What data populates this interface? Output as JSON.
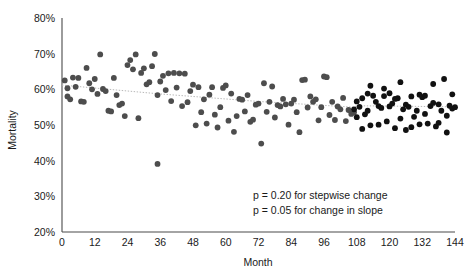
{
  "chart_data": {
    "type": "scatter",
    "title": "",
    "xlabel": "Month",
    "ylabel": "Mortality",
    "xlim": [
      0,
      144
    ],
    "ylim": [
      20,
      80
    ],
    "grid": false,
    "legend": "none",
    "x_ticks": [
      0,
      12,
      24,
      36,
      48,
      60,
      72,
      84,
      96,
      108,
      120,
      132,
      144
    ],
    "x_tick_labels": [
      "0",
      "12",
      "24",
      "36",
      "48",
      "60",
      "72",
      "84",
      "96",
      "108",
      "120",
      "132",
      "144"
    ],
    "y_ticks": [
      20,
      30,
      40,
      50,
      60,
      70,
      80
    ],
    "y_tick_labels": [
      "20%",
      "30%",
      "40%",
      "50%",
      "60%",
      "70%",
      "80%"
    ],
    "annotations": [
      "p = 0.20 for stepwise change",
      "p = 0.05 for change in slope"
    ],
    "trendline": {
      "name": "fitted dotted trend",
      "color": "#b8b8b8",
      "style": "dotted",
      "x": [
        0,
        36,
        72,
        107,
        108,
        144
      ],
      "y": [
        61.2,
        58.7,
        56.6,
        55.0,
        55.4,
        55.1
      ]
    },
    "series": [
      {
        "name": "Pre-intervention (gray)",
        "color": "#4d4d4d",
        "marker": "filled-circle",
        "points": [
          [
            1,
            62.5
          ],
          [
            2,
            60.3
          ],
          [
            2,
            58.0
          ],
          [
            3,
            57.2
          ],
          [
            4,
            63.3
          ],
          [
            5,
            60.7
          ],
          [
            6,
            63.2
          ],
          [
            7,
            56.6
          ],
          [
            8,
            56.5
          ],
          [
            9,
            66.0
          ],
          [
            10,
            61.7
          ],
          [
            11,
            60.0
          ],
          [
            12,
            62.9
          ],
          [
            13,
            58.7
          ],
          [
            14,
            69.8
          ],
          [
            15,
            60.1
          ],
          [
            16,
            59.5
          ],
          [
            17,
            54.0
          ],
          [
            18,
            53.8
          ],
          [
            19,
            63.2
          ],
          [
            20,
            58.4
          ],
          [
            21,
            55.6
          ],
          [
            22,
            56.0
          ],
          [
            23,
            52.5
          ],
          [
            24,
            66.8
          ],
          [
            25,
            68.2
          ],
          [
            26,
            65.6
          ],
          [
            27,
            69.8
          ],
          [
            28,
            51.9
          ],
          [
            29,
            64.6
          ],
          [
            30,
            65.9
          ],
          [
            31,
            61.4
          ],
          [
            32,
            62.0
          ],
          [
            33,
            66.5
          ],
          [
            34,
            69.9
          ],
          [
            35,
            58.4
          ],
          [
            35,
            39.1
          ],
          [
            36,
            62.2
          ],
          [
            37,
            63.8
          ],
          [
            38,
            59.8
          ],
          [
            39,
            64.5
          ],
          [
            40,
            56.7
          ],
          [
            41,
            64.6
          ],
          [
            42,
            60.5
          ],
          [
            43,
            64.5
          ],
          [
            44,
            55.3
          ],
          [
            45,
            64.4
          ],
          [
            46,
            56.4
          ],
          [
            47,
            59.5
          ],
          [
            48,
            61.3
          ],
          [
            49,
            49.9
          ],
          [
            50,
            60.6
          ],
          [
            51,
            53.6
          ],
          [
            52,
            57.2
          ],
          [
            53,
            50.4
          ],
          [
            54,
            58.5
          ],
          [
            55,
            60.6
          ],
          [
            56,
            52.9
          ],
          [
            57,
            49.3
          ],
          [
            58,
            55.0
          ],
          [
            59,
            60.4
          ],
          [
            60,
            61.1
          ],
          [
            61,
            51.2
          ],
          [
            62,
            58.8
          ],
          [
            63,
            48.1
          ],
          [
            64,
            52.5
          ],
          [
            65,
            57.3
          ],
          [
            66,
            57.1
          ],
          [
            67,
            53.8
          ],
          [
            68,
            58.4
          ],
          [
            69,
            50.9
          ],
          [
            70,
            51.5
          ],
          [
            71,
            55.7
          ],
          [
            72,
            56.0
          ],
          [
            73,
            44.8
          ],
          [
            74,
            61.7
          ],
          [
            75,
            53.7
          ],
          [
            76,
            56.5
          ],
          [
            77,
            60.8
          ],
          [
            78,
            52.1
          ],
          [
            79,
            55.6
          ],
          [
            80,
            55.2
          ],
          [
            81,
            57.3
          ],
          [
            82,
            55.8
          ],
          [
            83,
            50.1
          ],
          [
            84,
            56.0
          ],
          [
            85,
            57.1
          ],
          [
            86,
            53.6
          ],
          [
            87,
            48.0
          ],
          [
            88,
            62.6
          ],
          [
            89,
            62.7
          ],
          [
            90,
            54.9
          ],
          [
            91,
            58.0
          ],
          [
            92,
            56.5
          ],
          [
            93,
            57.2
          ],
          [
            94,
            51.3
          ],
          [
            95,
            55.0
          ],
          [
            96,
            63.6
          ],
          [
            97,
            63.4
          ],
          [
            98,
            52.8
          ],
          [
            99,
            56.5
          ],
          [
            100,
            51.4
          ],
          [
            101,
            55.2
          ],
          [
            102,
            54.4
          ],
          [
            103,
            57.6
          ],
          [
            104,
            51.1
          ],
          [
            105,
            54.2
          ],
          [
            106,
            53.1
          ],
          [
            107,
            53.6
          ]
        ]
      },
      {
        "name": "Post-intervention (black)",
        "color": "#111111",
        "marker": "filled-circle",
        "points": [
          [
            107,
            54.4
          ],
          [
            108,
            52.2
          ],
          [
            108,
            56.6
          ],
          [
            109,
            55.1
          ],
          [
            110,
            57.5
          ],
          [
            111,
            53.0
          ],
          [
            112,
            54.0
          ],
          [
            113,
            49.9
          ],
          [
            114,
            58.2
          ],
          [
            115,
            56.5
          ],
          [
            116,
            55.3
          ],
          [
            117,
            54.8
          ],
          [
            118,
            58.1
          ],
          [
            119,
            51.0
          ],
          [
            120,
            55.2
          ],
          [
            121,
            56.0
          ],
          [
            122,
            57.3
          ],
          [
            123,
            57.5
          ],
          [
            124,
            62.0
          ],
          [
            125,
            54.4
          ],
          [
            126,
            55.7
          ],
          [
            127,
            55.1
          ],
          [
            128,
            58.0
          ],
          [
            129,
            52.3
          ],
          [
            130,
            54.0
          ],
          [
            131,
            58.5
          ],
          [
            132,
            57.8
          ],
          [
            133,
            58.2
          ],
          [
            134,
            50.4
          ],
          [
            135,
            55.3
          ],
          [
            136,
            56.2
          ],
          [
            137,
            49.6
          ],
          [
            138,
            55.8
          ],
          [
            139,
            54.0
          ],
          [
            140,
            62.9
          ],
          [
            141,
            52.6
          ],
          [
            142,
            55.4
          ],
          [
            143,
            54.6
          ],
          [
            144,
            55.0
          ],
          [
            110,
            48.9
          ],
          [
            113,
            61.0
          ],
          [
            118,
            60.2
          ],
          [
            122,
            49.1
          ],
          [
            126,
            48.6
          ],
          [
            131,
            50.2
          ],
          [
            136,
            61.5
          ],
          [
            141,
            47.9
          ],
          [
            112,
            58.8
          ],
          [
            116,
            50.1
          ],
          [
            120,
            58.9
          ],
          [
            124,
            51.8
          ],
          [
            128,
            49.4
          ],
          [
            133,
            53.1
          ],
          [
            138,
            50.6
          ],
          [
            143,
            58.6
          ]
        ]
      }
    ]
  },
  "axes": {
    "y_axis_label": "Mortality",
    "x_axis_label": "Month"
  }
}
